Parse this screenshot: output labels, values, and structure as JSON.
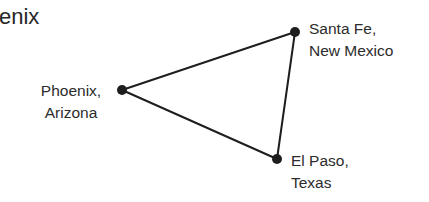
{
  "title_fragment": "enix",
  "diagram": {
    "line_color": "#1e1e1e",
    "node_color": "#1e1e1e",
    "nodes": [
      {
        "id": "phoenix",
        "x": 122,
        "y": 90,
        "label_line1": "Phoenix,",
        "label_line2": "Arizona"
      },
      {
        "id": "santa-fe",
        "x": 295,
        "y": 32,
        "label_line1": "Santa Fe,",
        "label_line2": "New Mexico"
      },
      {
        "id": "el-paso",
        "x": 277,
        "y": 159,
        "label_line1": "El Paso,",
        "label_line2": "Texas"
      }
    ],
    "edges": [
      [
        "phoenix",
        "santa-fe"
      ],
      [
        "santa-fe",
        "el-paso"
      ],
      [
        "el-paso",
        "phoenix"
      ]
    ]
  }
}
